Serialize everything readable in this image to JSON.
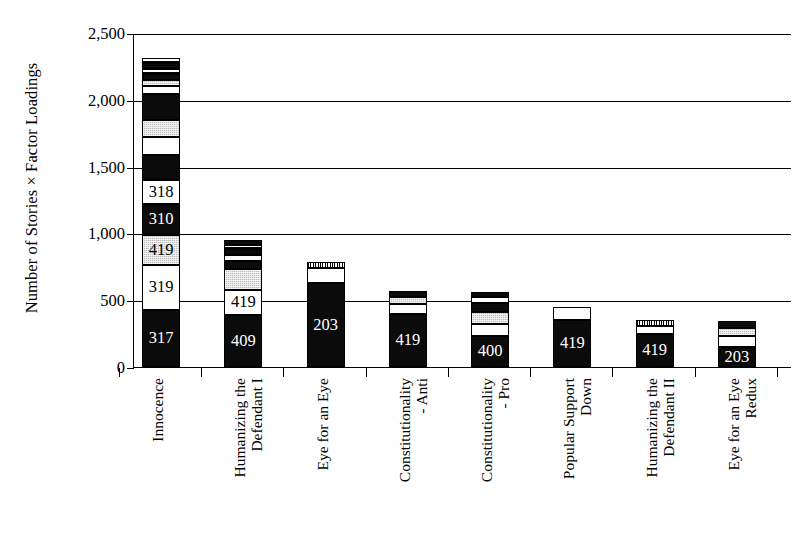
{
  "chart_data": {
    "type": "bar",
    "subtype": "stacked-bar",
    "title": "",
    "xlabel": "",
    "ylabel": "Number of Stories × Factor Loadings",
    "ylim": [
      0,
      2500
    ],
    "ytick_values": [
      0,
      500,
      1000,
      1500,
      2000,
      2500
    ],
    "ytick_labels": [
      "0",
      "500",
      "1,000",
      "1,500",
      "2,000",
      "2,500"
    ],
    "grid": true,
    "grid_axis": "y",
    "legend": "none",
    "categories": [
      "Innocence",
      "Humanizing the Defendant I",
      "Eye for an Eye",
      "Constitutionality - Anti",
      "Constitutionality - Pro",
      "Popular Support Down",
      "Humanizing the Defendant II",
      "Eye for an Eye Redux"
    ],
    "category_lines": [
      [
        "Innocence",
        ""
      ],
      [
        "Humanizing the",
        "Defendant I"
      ],
      [
        "Eye for an Eye",
        ""
      ],
      [
        "Constitutionality",
        "- Anti"
      ],
      [
        "Constitutionality",
        "- Pro"
      ],
      [
        "Popular Support",
        "Down"
      ],
      [
        "Humanizing the",
        "Defendant II"
      ],
      [
        "Eye for an Eye",
        "Redux"
      ]
    ],
    "totals": [
      2310,
      950,
      785,
      570,
      560,
      450,
      350,
      345
    ],
    "bars": [
      {
        "category": "Innocence",
        "total": 2310,
        "segments": [
          {
            "label": "317",
            "value": 430,
            "fill": "black"
          },
          {
            "label": "319",
            "value": 330,
            "fill": "white"
          },
          {
            "label": "419",
            "value": 230,
            "fill": "gray"
          },
          {
            "label": "310",
            "value": 230,
            "fill": "black"
          },
          {
            "label": "318",
            "value": 180,
            "fill": "white"
          },
          {
            "label": "",
            "value": 190,
            "fill": "black"
          },
          {
            "label": "",
            "value": 130,
            "fill": "white"
          },
          {
            "label": "",
            "value": 130,
            "fill": "gray"
          },
          {
            "label": "",
            "value": 190,
            "fill": "black"
          },
          {
            "label": "",
            "value": 60,
            "fill": "white"
          },
          {
            "label": "",
            "value": 50,
            "fill": "gray"
          },
          {
            "label": "",
            "value": 45,
            "fill": "black"
          },
          {
            "label": "",
            "value": 40,
            "fill": "hatch"
          },
          {
            "label": "",
            "value": 40,
            "fill": "black"
          },
          {
            "label": "",
            "value": 35,
            "fill": "hatch"
          }
        ]
      },
      {
        "category": "Humanizing the Defendant I",
        "total": 950,
        "segments": [
          {
            "label": "409",
            "value": 390,
            "fill": "black"
          },
          {
            "label": "419",
            "value": 185,
            "fill": "white"
          },
          {
            "label": "",
            "value": 160,
            "fill": "gray"
          },
          {
            "label": "",
            "value": 55,
            "fill": "black"
          },
          {
            "label": "",
            "value": 45,
            "fill": "white"
          },
          {
            "label": "",
            "value": 45,
            "fill": "black"
          },
          {
            "label": "",
            "value": 35,
            "fill": "hatch"
          },
          {
            "label": "",
            "value": 35,
            "fill": "black"
          }
        ]
      },
      {
        "category": "Eye for an Eye",
        "total": 785,
        "segments": [
          {
            "label": "203",
            "value": 630,
            "fill": "black"
          },
          {
            "label": "",
            "value": 110,
            "fill": "white"
          },
          {
            "label": "",
            "value": 45,
            "fill": "vhatch"
          }
        ]
      },
      {
        "category": "Constitutionality - Anti",
        "total": 570,
        "segments": [
          {
            "label": "419",
            "value": 400,
            "fill": "black"
          },
          {
            "label": "",
            "value": 70,
            "fill": "white"
          },
          {
            "label": "",
            "value": 55,
            "fill": "gray"
          },
          {
            "label": "",
            "value": 45,
            "fill": "black"
          }
        ]
      },
      {
        "category": "Constitutionality - Pro",
        "total": 560,
        "segments": [
          {
            "label": "400",
            "value": 230,
            "fill": "black"
          },
          {
            "label": "",
            "value": 95,
            "fill": "white"
          },
          {
            "label": "",
            "value": 85,
            "fill": "gray"
          },
          {
            "label": "",
            "value": 70,
            "fill": "black"
          },
          {
            "label": "",
            "value": 45,
            "fill": "white"
          },
          {
            "label": "",
            "value": 35,
            "fill": "black"
          }
        ]
      },
      {
        "category": "Popular Support Down",
        "total": 450,
        "segments": [
          {
            "label": "419",
            "value": 355,
            "fill": "black"
          },
          {
            "label": "",
            "value": 95,
            "fill": "white"
          }
        ]
      },
      {
        "category": "Humanizing the Defendant II",
        "total": 350,
        "segments": [
          {
            "label": "419",
            "value": 250,
            "fill": "black"
          },
          {
            "label": "",
            "value": 60,
            "fill": "white"
          },
          {
            "label": "",
            "value": 40,
            "fill": "vhatch"
          }
        ]
      },
      {
        "category": "Eye for an Eye Redux",
        "total": 345,
        "segments": [
          {
            "label": "203",
            "value": 150,
            "fill": "black"
          },
          {
            "label": "",
            "value": 80,
            "fill": "white"
          },
          {
            "label": "",
            "value": 60,
            "fill": "gray"
          },
          {
            "label": "",
            "value": 55,
            "fill": "black"
          }
        ]
      }
    ]
  }
}
